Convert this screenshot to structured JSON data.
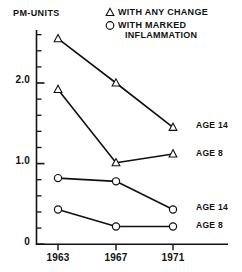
{
  "axis_title": "PM-UNITS",
  "legend": {
    "items": [
      {
        "marker": "triangle",
        "label": "WITH ANY CHANGE",
        "label_line2": ""
      },
      {
        "marker": "circle",
        "label": "WITH MARKED",
        "label_line2": "INFLAMMATION"
      }
    ]
  },
  "series_labels": [
    "AGE 14",
    "AGE 8",
    "AGE 14",
    "AGE 8"
  ],
  "chart_data": {
    "type": "line",
    "title": "",
    "subtitle": "",
    "xlabel": "",
    "ylabel": "PM-UNITS",
    "x": [
      "1963",
      "1967",
      "1971"
    ],
    "xtick_labels": [
      "1963",
      "1967",
      "1971"
    ],
    "ytick_labels": [
      "0",
      "1.0",
      "2.0"
    ],
    "ytick_values": [
      0,
      1.0,
      2.0
    ],
    "ylim": [
      0,
      2.75
    ],
    "yminor_step": 0.2,
    "grid": false,
    "legend_position": "top-right",
    "series": [
      {
        "name": "WITH ANY CHANGE - AGE 14",
        "marker": "triangle",
        "end_label": "AGE 14",
        "values": [
          2.55,
          2.0,
          1.45
        ]
      },
      {
        "name": "WITH ANY CHANGE - AGE 8",
        "marker": "triangle",
        "end_label": "AGE 8",
        "values": [
          1.92,
          1.01,
          1.12
        ]
      },
      {
        "name": "WITH MARKED INFLAMMATION - AGE 14",
        "marker": "circle",
        "end_label": "AGE 14",
        "values": [
          0.82,
          0.78,
          0.43
        ]
      },
      {
        "name": "WITH MARKED INFLAMMATION - AGE 8",
        "marker": "circle",
        "end_label": "AGE 8",
        "values": [
          0.43,
          0.22,
          0.22
        ]
      }
    ],
    "colors": {
      "line": "#111111",
      "marker_stroke": "#111111",
      "marker_fill": "#ffffff",
      "axis": "#111111",
      "background": "#ffffff"
    }
  }
}
